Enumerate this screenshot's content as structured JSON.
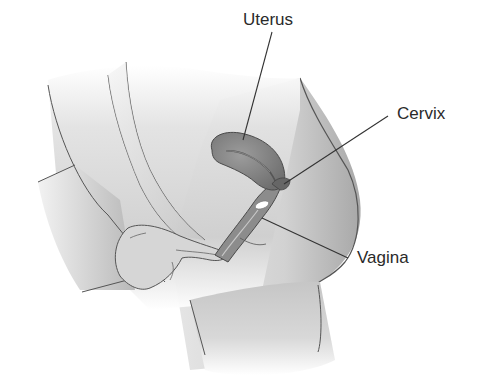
{
  "diagram": {
    "type": "anatomical-illustration",
    "labels": {
      "uterus": "Uterus",
      "cervix": "Cervix",
      "vagina": "Vagina"
    },
    "colors": {
      "background": "#ffffff",
      "skin_light": "#e4e4e4",
      "skin_mid": "#c8c8c8",
      "skin_dark": "#9a9a9a",
      "organ": "#8a8a8a",
      "organ_dark": "#5e5e5e",
      "outline": "#4a4a4a",
      "leader_line": "#333333",
      "text": "#2a2a2a"
    }
  }
}
